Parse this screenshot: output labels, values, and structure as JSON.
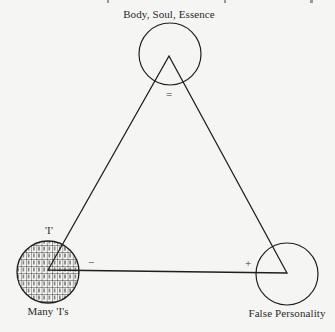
{
  "diagram": {
    "type": "triangle-with-circles",
    "colors": {
      "background": "#f5f5f3",
      "stroke": "#1e1e1e",
      "text": "#2a2a2a"
    },
    "vertices": {
      "top": {
        "label": "Body, Soul, Essence",
        "sign": "=",
        "circle": "open"
      },
      "bottom_left": {
        "label_above": "'I'",
        "label_below": "Many 'I's",
        "sign": "−",
        "circle": "filled-grid-of-I"
      },
      "bottom_right": {
        "label": "False Personality",
        "sign": "+",
        "circle": "open"
      }
    }
  }
}
